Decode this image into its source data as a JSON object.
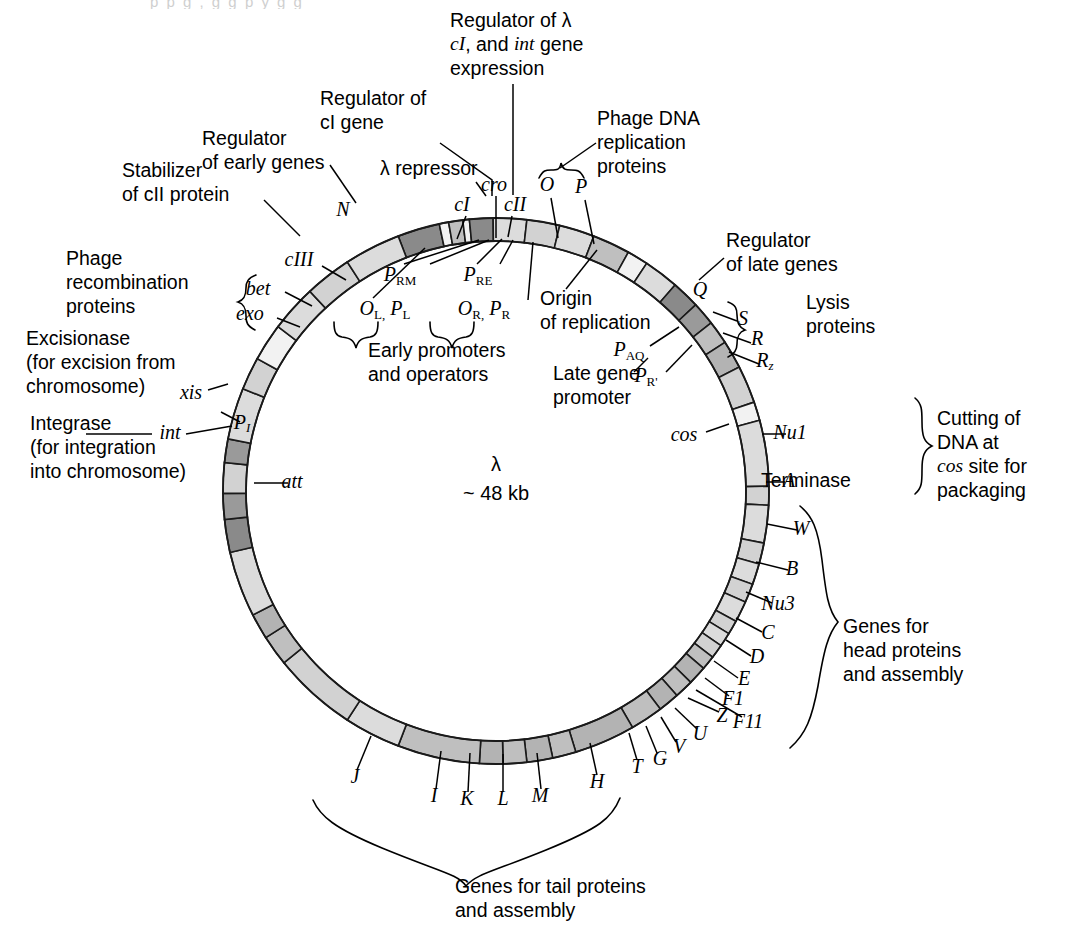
{
  "figure": {
    "center_label_line1": "λ",
    "center_label_line2": "~ 48 kb",
    "cut_top_text": "p p g ,  g  g  p y g  g"
  },
  "colors": {
    "light": "#dcdcdc",
    "light2": "#d2d2d2",
    "medium": "#bfbfbf",
    "medium2": "#b3b3b3",
    "dark": "#9a9a9a",
    "darker": "#8a8a8a",
    "white": "#f2f2f2",
    "stroke": "#1a1a1a"
  },
  "ring": {
    "cx": 496,
    "cy": 491,
    "r_outer": 273,
    "r_inner": 250,
    "segments": [
      {
        "name": "cI",
        "a0": -21.0,
        "a1": -12.0,
        "shade": "darker"
      },
      {
        "name": "gap1",
        "a0": -12.0,
        "a1": -10.0,
        "shade": "white"
      },
      {
        "name": "cro",
        "a0": -10.0,
        "a1": -7.0,
        "shade": "medium"
      },
      {
        "name": "gap2",
        "a0": -7.0,
        "a1": -5.6,
        "shade": "white"
      },
      {
        "name": "cII",
        "a0": -5.6,
        "a1": -0.6,
        "shade": "darker"
      },
      {
        "name": "O",
        "a0": -0.6,
        "a1": 6.5,
        "shade": "light"
      },
      {
        "name": "P",
        "a0": 6.5,
        "a1": 13.5,
        "shade": "light2"
      },
      {
        "name": "ren",
        "a0": 13.5,
        "a1": 21.0,
        "shade": "light"
      },
      {
        "name": "pre-Q",
        "a0": 21.0,
        "a1": 29.0,
        "shade": "medium"
      },
      {
        "name": "Qgap",
        "a0": 29.0,
        "a1": 33.5,
        "shade": "white"
      },
      {
        "name": "Q",
        "a0": 33.5,
        "a1": 41.0,
        "shade": "light"
      },
      {
        "name": "S",
        "a0": 41.0,
        "a1": 47.0,
        "shade": "darker"
      },
      {
        "name": "R",
        "a0": 47.0,
        "a1": 52.0,
        "shade": "dark"
      },
      {
        "name": "Rz",
        "a0": 52.0,
        "a1": 57.0,
        "shade": "medium"
      },
      {
        "name": "Rz2",
        "a0": 57.0,
        "a1": 63.0,
        "shade": "medium2"
      },
      {
        "name": "preco",
        "a0": 63.0,
        "a1": 71.0,
        "shade": "light2"
      },
      {
        "name": "Nu1",
        "a0": 71.0,
        "a1": 75.0,
        "shade": "white"
      },
      {
        "name": "A",
        "a0": 75.0,
        "a1": 89.0,
        "shade": "light"
      },
      {
        "name": "W",
        "a0": 89.0,
        "a1": 93.0,
        "shade": "light2"
      },
      {
        "name": "B",
        "a0": 93.0,
        "a1": 101.0,
        "shade": "light"
      },
      {
        "name": "Nu3",
        "a0": 101.0,
        "a1": 105.5,
        "shade": "light2"
      },
      {
        "name": "C",
        "a0": 105.5,
        "a1": 110.0,
        "shade": "light"
      },
      {
        "name": "D",
        "a0": 110.0,
        "a1": 114.0,
        "shade": "light2"
      },
      {
        "name": "E",
        "a0": 114.0,
        "a1": 118.5,
        "shade": "light"
      },
      {
        "name": "F1",
        "a0": 118.5,
        "a1": 121.5,
        "shade": "light2"
      },
      {
        "name": "F11",
        "a0": 121.5,
        "a1": 124.5,
        "shade": "light"
      },
      {
        "name": "Z",
        "a0": 124.5,
        "a1": 127.5,
        "shade": "light2"
      },
      {
        "name": "U",
        "a0": 127.5,
        "a1": 130.5,
        "shade": "medium"
      },
      {
        "name": "V",
        "a0": 130.5,
        "a1": 134.5,
        "shade": "medium2"
      },
      {
        "name": "G",
        "a0": 134.5,
        "a1": 138.5,
        "shade": "medium"
      },
      {
        "name": "T",
        "a0": 138.5,
        "a1": 143.0,
        "shade": "medium2"
      },
      {
        "name": "Tgap",
        "a0": 143.0,
        "a1": 150.0,
        "shade": "medium"
      },
      {
        "name": "H",
        "a0": 150.0,
        "a1": 163.0,
        "shade": "medium2"
      },
      {
        "name": "M",
        "a0": 163.0,
        "a1": 168.0,
        "shade": "medium"
      },
      {
        "name": "L",
        "a0": 168.0,
        "a1": 173.5,
        "shade": "medium2"
      },
      {
        "name": "K",
        "a0": 173.5,
        "a1": 178.5,
        "shade": "medium"
      },
      {
        "name": "I",
        "a0": 178.5,
        "a1": 183.5,
        "shade": "medium2"
      },
      {
        "name": "J",
        "a0": 183.5,
        "a1": 201.0,
        "shade": "medium"
      },
      {
        "name": "Jgap",
        "a0": 201.0,
        "a1": 213.0,
        "shade": "light"
      },
      {
        "name": "att",
        "a0": 213.0,
        "a1": 231.0,
        "shade": "light2"
      },
      {
        "name": "int",
        "a0": 231.0,
        "a1": 237.5,
        "shade": "medium"
      },
      {
        "name": "PI",
        "a0": 237.5,
        "a1": 243.0,
        "shade": "medium2"
      },
      {
        "name": "xisr",
        "a0": 243.0,
        "a1": 257.0,
        "shade": "light"
      },
      {
        "name": "exo",
        "a0": 257.0,
        "a1": 264.0,
        "shade": "darker"
      },
      {
        "name": "bet",
        "a0": 264.0,
        "a1": 269.5,
        "shade": "dark"
      },
      {
        "name": "gam",
        "a0": 269.5,
        "a1": 276.0,
        "shade": "light2"
      },
      {
        "name": "cIII",
        "a0": 276.0,
        "a1": 281.0,
        "shade": "dark"
      },
      {
        "name": "cIIIb",
        "a0": 281.0,
        "a1": 292.0,
        "shade": "light"
      },
      {
        "name": "N",
        "a0": 292.0,
        "a1": 299.0,
        "shade": "light2"
      },
      {
        "name": "Ngap",
        "a0": 299.0,
        "a1": 307.0,
        "shade": "white"
      },
      {
        "name": "nu1",
        "a0": 307.0,
        "a1": 317.0,
        "shade": "light"
      },
      {
        "name": "nu2",
        "a0": 317.0,
        "a1": 327.0,
        "shade": "light2"
      },
      {
        "name": "nu3",
        "a0": 327.0,
        "a1": 339.0,
        "shade": "light"
      }
    ]
  },
  "gene_labels": [
    {
      "id": "N",
      "text": "N",
      "x": 343,
      "y": 211,
      "style": "ital"
    },
    {
      "id": "cI",
      "text": "cI",
      "x": 462,
      "y": 206,
      "style": "ital"
    },
    {
      "id": "cro",
      "text": "cro",
      "x": 494,
      "y": 186,
      "style": "ital"
    },
    {
      "id": "cII",
      "text": "cII",
      "x": 515,
      "y": 206,
      "style": "ital"
    },
    {
      "id": "O",
      "text": "O",
      "x": 547,
      "y": 186,
      "style": "ital"
    },
    {
      "id": "P",
      "text": "P",
      "x": 581,
      "y": 188,
      "style": "ital"
    },
    {
      "id": "cIII",
      "text": "cIII",
      "x": 299,
      "y": 261,
      "style": "ital"
    },
    {
      "id": "bet",
      "text": "bet",
      "x": 258,
      "y": 290,
      "style": "ital"
    },
    {
      "id": "exo",
      "text": "exo",
      "x": 250,
      "y": 315,
      "style": "ital"
    },
    {
      "id": "xis",
      "text": "xis",
      "x": 191,
      "y": 394,
      "style": "ital"
    },
    {
      "id": "int",
      "text": "int",
      "x": 170,
      "y": 434,
      "style": "ital"
    },
    {
      "id": "PI",
      "text": "P",
      "sub": "I",
      "x": 242,
      "y": 424,
      "style": "ital"
    },
    {
      "id": "att",
      "text": "att",
      "x": 292,
      "y": 483,
      "style": "ital"
    },
    {
      "id": "Q",
      "text": "Q",
      "x": 700,
      "y": 291,
      "style": "ital"
    },
    {
      "id": "S",
      "text": "S",
      "x": 743,
      "y": 320,
      "style": "ital"
    },
    {
      "id": "R",
      "text": "R",
      "x": 757,
      "y": 340,
      "style": "ital"
    },
    {
      "id": "Rz",
      "text": "R",
      "sub": "z",
      "x": 765,
      "y": 362,
      "style": "ital"
    },
    {
      "id": "cos",
      "text": "cos",
      "x": 684,
      "y": 436,
      "style": "ital"
    },
    {
      "id": "Nu1",
      "text": "Nu1",
      "x": 790,
      "y": 434,
      "style": "ital"
    },
    {
      "id": "A",
      "text": "A",
      "x": 789,
      "y": 482,
      "style": "ital"
    },
    {
      "id": "Aterm",
      "text": "Terminase",
      "x": 806,
      "y": 482,
      "style": "sans"
    },
    {
      "id": "W",
      "text": "W",
      "x": 801,
      "y": 530,
      "style": "ital"
    },
    {
      "id": "B",
      "text": "B",
      "x": 792,
      "y": 570,
      "style": "ital"
    },
    {
      "id": "Nu3",
      "text": "Nu3",
      "x": 778,
      "y": 605,
      "style": "ital"
    },
    {
      "id": "C",
      "text": "C",
      "x": 768,
      "y": 634,
      "style": "ital"
    },
    {
      "id": "D",
      "text": "D",
      "x": 757,
      "y": 658,
      "style": "ital"
    },
    {
      "id": "E",
      "text": "E",
      "x": 744,
      "y": 680,
      "style": "ital"
    },
    {
      "id": "F1",
      "text": "F1",
      "x": 733,
      "y": 700,
      "style": "ital"
    },
    {
      "id": "F11",
      "text": "F11",
      "x": 748,
      "y": 723,
      "style": "ital"
    },
    {
      "id": "Z",
      "text": "Z",
      "x": 722,
      "y": 717,
      "style": "ital"
    },
    {
      "id": "U",
      "text": "U",
      "x": 700,
      "y": 735,
      "style": "ital"
    },
    {
      "id": "V",
      "text": "V",
      "x": 679,
      "y": 748,
      "style": "ital"
    },
    {
      "id": "G",
      "text": "G",
      "x": 660,
      "y": 760,
      "style": "ital"
    },
    {
      "id": "T",
      "text": "T",
      "x": 637,
      "y": 768,
      "style": "ital"
    },
    {
      "id": "H",
      "text": "H",
      "x": 597,
      "y": 783,
      "style": "ital"
    },
    {
      "id": "M",
      "text": "M",
      "x": 540,
      "y": 797,
      "style": "ital"
    },
    {
      "id": "L",
      "text": "L",
      "x": 503,
      "y": 800,
      "style": "ital"
    },
    {
      "id": "K",
      "text": "K",
      "x": 467,
      "y": 800,
      "style": "ital"
    },
    {
      "id": "I",
      "text": "I",
      "x": 434,
      "y": 797,
      "style": "ital"
    },
    {
      "id": "J",
      "text": "J",
      "x": 355,
      "y": 778,
      "style": "ital"
    }
  ],
  "promoter_labels": [
    {
      "id": "PRM",
      "base": "P",
      "sub": "RM",
      "x": 400,
      "y": 276
    },
    {
      "id": "PRE",
      "base": "P",
      "sub": "RE",
      "x": 478,
      "y": 276
    },
    {
      "id": "OLPL",
      "base": "O",
      "sub": "L,",
      "base2": "P",
      "sub2": "L",
      "x": 385,
      "y": 310
    },
    {
      "id": "ORPR",
      "base": "O",
      "sub": "R,",
      "base2": "P",
      "sub2": "R",
      "x": 484,
      "y": 310
    },
    {
      "id": "PAQ",
      "base": "P",
      "sub": "AQ",
      "x": 629,
      "y": 351
    },
    {
      "id": "PRp",
      "base": "P",
      "sub": "R'",
      "x": 646,
      "y": 377
    }
  ],
  "callouts": [
    {
      "id": "regulator-lambda",
      "lines": [
        "Regulator of λ",
        "cI, and int gene",
        "expression"
      ],
      "x": 450,
      "y": 22,
      "align": "start",
      "ital_words": [
        "cI",
        "int"
      ]
    },
    {
      "id": "regulator-cI",
      "lines": [
        "Regulator of",
        "cI gene"
      ],
      "x": 320,
      "y": 100,
      "align": "start"
    },
    {
      "id": "lambda-repressor",
      "lines": [
        "λ repressor"
      ],
      "x": 380,
      "y": 170,
      "align": "start"
    },
    {
      "id": "regulator-early",
      "lines": [
        "Regulator",
        "of early genes"
      ],
      "x": 202,
      "y": 140,
      "align": "start"
    },
    {
      "id": "stabilizer-cII",
      "lines": [
        "Stabilizer",
        "of cII protein"
      ],
      "x": 122,
      "y": 172,
      "align": "start"
    },
    {
      "id": "phage-recombination",
      "lines": [
        "Phage",
        "recombination",
        "proteins"
      ],
      "x": 66,
      "y": 260,
      "align": "start"
    },
    {
      "id": "excisionase",
      "lines": [
        "Excisionase",
        "(for excision from",
        "chromosome)"
      ],
      "x": 26,
      "y": 340,
      "align": "start"
    },
    {
      "id": "integrase",
      "lines": [
        "Integrase",
        "(for integration",
        "into chromosome)"
      ],
      "x": 30,
      "y": 425,
      "align": "start"
    },
    {
      "id": "phage-dna-replication",
      "lines": [
        "Phage DNA",
        "replication",
        "proteins"
      ],
      "x": 597,
      "y": 120,
      "align": "start"
    },
    {
      "id": "regulator-late",
      "lines": [
        "Regulator",
        "of late genes"
      ],
      "x": 726,
      "y": 242,
      "align": "start"
    },
    {
      "id": "lysis-proteins",
      "lines": [
        "Lysis",
        "proteins"
      ],
      "x": 806,
      "y": 304,
      "align": "start"
    },
    {
      "id": "origin-replication",
      "lines": [
        "Origin",
        "of replication"
      ],
      "x": 540,
      "y": 300,
      "align": "start"
    },
    {
      "id": "early-promoters",
      "lines": [
        "Early promoters",
        "and operators"
      ],
      "x": 368,
      "y": 352,
      "align": "start"
    },
    {
      "id": "late-gene-promoter",
      "lines": [
        "Late gene",
        "promoter"
      ],
      "x": 553,
      "y": 375,
      "align": "start"
    },
    {
      "id": "cutting-dna",
      "lines": [
        "Cutting of",
        "DNA at",
        "cos site for",
        "packaging"
      ],
      "x": 937,
      "y": 420,
      "align": "start",
      "ital_words": [
        "cos"
      ]
    },
    {
      "id": "genes-head",
      "lines": [
        "Genes for",
        "head proteins",
        "and assembly"
      ],
      "x": 843,
      "y": 628,
      "align": "start"
    },
    {
      "id": "genes-tail",
      "lines": [
        "Genes for tail proteins",
        "and assembly"
      ],
      "x": 455,
      "y": 888,
      "align": "start"
    }
  ],
  "leaders": [
    {
      "id": "lead-regulator-lambda",
      "d": "M 513 84 L 513 195"
    },
    {
      "id": "lead-regulator-cI",
      "d": "M 440 143 L 492 180 L 492 196"
    },
    {
      "id": "lead-lambda-repressor",
      "d": "M 476 182 L 486 196"
    },
    {
      "id": "lead-regulator-early",
      "d": "M 330 165 L 356 203"
    },
    {
      "id": "lead-stabilizer-cII",
      "d": "M 264 200 L 300 236"
    },
    {
      "id": "lead-phage-dna-rep",
      "d": "M 596 143 L 560 168"
    },
    {
      "id": "lead-regulator-late",
      "d": "M 724 258 L 699 280"
    },
    {
      "id": "lead-cI-tick",
      "d": "M 466 216 L 457 239"
    },
    {
      "id": "lead-cro-tick",
      "d": "M 496 196 L 496 238"
    },
    {
      "id": "lead-cII-tick",
      "d": "M 512 216 L 508 237"
    },
    {
      "id": "lead-O-tick",
      "d": "M 551 198 L 558 238"
    },
    {
      "id": "lead-P-tick",
      "d": "M 585 200 L 594 244"
    },
    {
      "id": "lead-cIII",
      "d": "M 322 266 L 346 280"
    },
    {
      "id": "lead-bet",
      "d": "M 285 292 L 312 306"
    },
    {
      "id": "lead-exo",
      "d": "M 277 318 L 300 327"
    },
    {
      "id": "lead-xis",
      "d": "M 208 390 L 228 384"
    },
    {
      "id": "lead-int",
      "d": "M 186 434 L 232 426"
    },
    {
      "id": "lead-int2",
      "d": "M 86 434 L 152 434"
    },
    {
      "id": "lead-PI",
      "d": "M 240 422 L 221 412"
    },
    {
      "id": "lead-att",
      "d": "M 288 483 L 254 483"
    },
    {
      "id": "lead-S",
      "d": "M 737 321 L 713 312"
    },
    {
      "id": "lead-R",
      "d": "M 751 343 L 723 333"
    },
    {
      "id": "lead-Rz",
      "d": "M 759 364 L 729 352"
    },
    {
      "id": "lead-cos",
      "d": "M 706 432 L 729 424"
    },
    {
      "id": "lead-Nu1",
      "d": "M 786 434 L 762 434"
    },
    {
      "id": "lead-A",
      "d": "M 785 482 L 766 482"
    },
    {
      "id": "lead-W",
      "d": "M 797 530 L 767 524"
    },
    {
      "id": "lead-B",
      "d": "M 788 570 L 756 562"
    },
    {
      "id": "lead-Nu3",
      "d": "M 772 603 L 746 592"
    },
    {
      "id": "lead-C",
      "d": "M 762 632 L 736 618"
    },
    {
      "id": "lead-D",
      "d": "M 751 656 L 726 640"
    },
    {
      "id": "lead-E",
      "d": "M 738 678 L 714 661"
    },
    {
      "id": "lead-F1",
      "d": "M 729 696 L 705 678"
    },
    {
      "id": "lead-F11",
      "d": "M 742 717 L 696 690"
    },
    {
      "id": "lead-Z",
      "d": "M 719 712 L 688 698"
    },
    {
      "id": "lead-U",
      "d": "M 697 729 L 675 708"
    },
    {
      "id": "lead-V",
      "d": "M 676 742 L 661 717"
    },
    {
      "id": "lead-G",
      "d": "M 657 753 L 646 726"
    },
    {
      "id": "lead-T",
      "d": "M 637 760 L 629 733"
    },
    {
      "id": "lead-H",
      "d": "M 597 775 L 590 743"
    },
    {
      "id": "lead-M",
      "d": "M 541 789 L 537 753"
    },
    {
      "id": "lead-L",
      "d": "M 503 792 L 503 754"
    },
    {
      "id": "lead-K",
      "d": "M 468 792 L 470 753"
    },
    {
      "id": "lead-I",
      "d": "M 436 789 L 441 751"
    },
    {
      "id": "lead-J",
      "d": "M 357 770 L 371 736"
    },
    {
      "id": "lead-PAQ",
      "d": "M 650 346 L 679 327"
    },
    {
      "id": "lead-PRp",
      "d": "M 666 372 L 692 345"
    },
    {
      "id": "lead-origin",
      "d": "M 566 289 L 597 250"
    },
    {
      "id": "lead-PRM",
      "d": "M 404 264 L 479 240"
    },
    {
      "id": "lead-PRM2",
      "d": "M 430 264 L 489 240"
    },
    {
      "id": "lead-PRE",
      "d": "M 477 264 L 502 239"
    },
    {
      "id": "lead-PRE2",
      "d": "M 500 264 L 513 240"
    },
    {
      "id": "lead-OLPL",
      "d": "M 373 298 L 425 248"
    },
    {
      "id": "lead-ORPR",
      "d": "M 528 300 L 533 242"
    },
    {
      "id": "lead-latepromoter",
      "d": "M 634 372 L 648 358"
    }
  ],
  "braces": [
    {
      "id": "brace-phage-dna",
      "d": "M 539 178 C 543 170 546 170 551 170 C 557 170 560 170 561 163 C 563 170 566 170 571 170 C 577 170 580 170 584 178"
    },
    {
      "id": "brace-recombination",
      "d": "M 255 330 C 247 326 246 322 246 316 C 246 308 244 304 238 302 C 244 300 246 296 246 288 C 246 282 248 278 256 275"
    },
    {
      "id": "brace-lysis",
      "d": "M 728 302 C 736 305 737 309 737 315 C 737 323 739 327 745 330 C 739 332 737 336 737 344 C 737 350 735 354 728 357"
    },
    {
      "id": "brace-early-promoters",
      "d": "M 334 322 C 334 332 336 336 342 337 C 350 338 354 340 356 348 C 358 340 362 338 370 337 C 376 336 378 332 378 322"
    },
    {
      "id": "brace-early-promoters2",
      "d": "M 430 322 C 430 332 432 336 438 337 C 446 338 450 340 452 348 C 454 340 458 338 466 337 C 472 336 474 332 474 322"
    },
    {
      "id": "brace-cutting",
      "d": "M 915 398 C 922 404 922 410 922 422 C 922 436 924 442 932 446 C 924 450 922 456 922 470 C 922 482 922 488 915 494"
    },
    {
      "id": "brace-head",
      "d": "M 800 506 C 812 516 818 528 822 560 C 826 594 828 610 838 622 C 828 634 824 650 818 686 C 812 718 806 734 790 748"
    },
    {
      "id": "brace-tail",
      "d": "M 313 800 C 320 816 334 828 382 848 C 440 872 458 874 466 886 C 476 874 492 872 546 850 C 600 828 612 818 620 798"
    }
  ]
}
